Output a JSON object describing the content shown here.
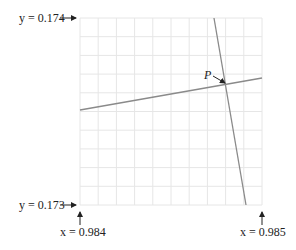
{
  "diagram": {
    "grid": {
      "x0": 80,
      "y0": 18,
      "x1": 262,
      "y1": 205,
      "cols": 10,
      "rows": 10,
      "color": "#e6e6e6"
    },
    "labels": {
      "y_top": "y = 0.174",
      "y_bottom": "y = 0.173",
      "x_left": "x = 0.984",
      "x_right": "x = 0.985",
      "point": "P"
    },
    "lines": [
      {
        "name": "shallow-line",
        "x1": 80,
        "y1": 110,
        "x2": 262,
        "y2": 78,
        "color": "#8a8a8a"
      },
      {
        "name": "steep-line",
        "x1": 214,
        "y1": 18,
        "x2": 246,
        "y2": 205,
        "color": "#8a8a8a"
      }
    ],
    "intersection": {
      "x": 227,
      "y": 84
    }
  }
}
